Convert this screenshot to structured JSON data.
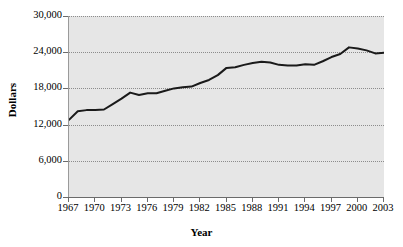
{
  "chart_data": {
    "type": "line",
    "title": "",
    "xlabel": "Year",
    "ylabel": "Dollars",
    "xlim": [
      1967,
      2003
    ],
    "ylim": [
      0,
      30000
    ],
    "grid": true,
    "legend": "none",
    "x_tick_labels": [
      "1967",
      "1970",
      "1973",
      "1976",
      "1979",
      "1982",
      "1985",
      "1988",
      "1991",
      "1994",
      "1997",
      "2000",
      "2003"
    ],
    "x_tick_values": [
      1967,
      1970,
      1973,
      1976,
      1979,
      1982,
      1985,
      1988,
      1991,
      1994,
      1997,
      2000,
      2003
    ],
    "y_tick_labels": [
      "0",
      "6,000",
      "12,000",
      "18,000",
      "24,000",
      "30,000"
    ],
    "y_tick_values": [
      0,
      6000,
      12000,
      18000,
      24000,
      30000
    ],
    "series": [
      {
        "name": "Median income",
        "color": "#1a1a1a",
        "x": [
          1967,
          1968,
          1969,
          1970,
          1971,
          1972,
          1973,
          1974,
          1975,
          1976,
          1977,
          1978,
          1979,
          1980,
          1981,
          1982,
          1983,
          1984,
          1985,
          1986,
          1987,
          1988,
          1989,
          1990,
          1991,
          1992,
          1993,
          1994,
          1995,
          1996,
          1997,
          1998,
          1999,
          2000,
          2001,
          2002,
          2003
        ],
        "values": [
          12800,
          14200,
          14400,
          14400,
          14500,
          15400,
          16300,
          17300,
          16900,
          17200,
          17200,
          17600,
          18000,
          18200,
          18300,
          18900,
          19400,
          20200,
          21400,
          21500,
          21900,
          22200,
          22400,
          22300,
          21900,
          21800,
          21800,
          22000,
          21900,
          22500,
          23200,
          23700,
          24800,
          24600,
          24300,
          23800,
          23900
        ]
      }
    ]
  },
  "axes": {
    "y_title": "Dollars",
    "x_title": "Year"
  }
}
